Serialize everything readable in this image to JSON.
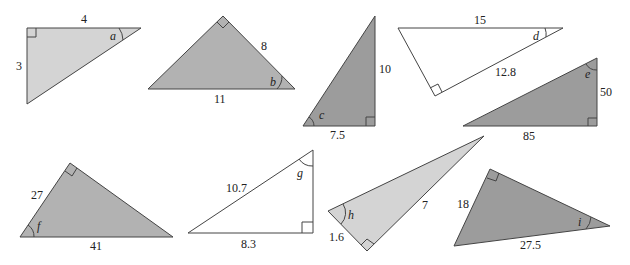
{
  "colors": {
    "light": "#d4d4d4",
    "medium": "#b2b2b2",
    "dark": "#9c9c9c",
    "white": "#ffffff",
    "stroke": "#444444"
  },
  "triangles": [
    {
      "id": "a",
      "angle_label": "a",
      "side_labels": [
        "4",
        "3"
      ],
      "fill": "light"
    },
    {
      "id": "b",
      "angle_label": "b",
      "side_labels": [
        "8",
        "11"
      ],
      "fill": "medium"
    },
    {
      "id": "c",
      "angle_label": "c",
      "side_labels": [
        "10",
        "7.5"
      ],
      "fill": "dark"
    },
    {
      "id": "d",
      "angle_label": "d",
      "side_labels": [
        "15",
        "12.8"
      ],
      "fill": "white"
    },
    {
      "id": "e",
      "angle_label": "e",
      "side_labels": [
        "50",
        "85"
      ],
      "fill": "dark"
    },
    {
      "id": "f",
      "angle_label": "f",
      "side_labels": [
        "27",
        "41"
      ],
      "fill": "medium"
    },
    {
      "id": "g",
      "angle_label": "g",
      "side_labels": [
        "10.7",
        "8.3"
      ],
      "fill": "white"
    },
    {
      "id": "h",
      "angle_label": "h",
      "side_labels": [
        "7",
        "1.6"
      ],
      "fill": "light"
    },
    {
      "id": "i",
      "angle_label": "i",
      "side_labels": [
        "18",
        "27.5"
      ],
      "fill": "dark"
    }
  ]
}
